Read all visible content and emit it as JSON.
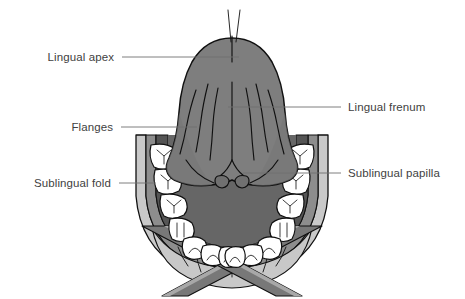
{
  "figure": {
    "width": 465,
    "height": 299,
    "background": "#ffffff"
  },
  "palette": {
    "background": "#ffffff",
    "tongue_fill": "#7e7e7e",
    "tongue_shadow": "#6e6e6e",
    "gingiva_fill": "#555555",
    "floor_fill": "#666666",
    "mucosa_band": "#8d8d8d",
    "cheek_fill": "#c9c9c9",
    "lip_fill": "#c8c8c8",
    "strap_fill": "#787878",
    "strap_edge": "#a8a8a8",
    "tooth_fill": "#ffffff",
    "outline": "#101010",
    "label_text": "#414141",
    "leader_line": "#6f6f6f"
  },
  "labels": [
    {
      "id": "lingual-apex",
      "text": "Lingual apex",
      "side": "left",
      "text_x": 114,
      "text_y": 61,
      "leader": {
        "x1": 122,
        "y1": 57,
        "x2": 239,
        "y2": 57
      }
    },
    {
      "id": "flanges",
      "text": "Flanges",
      "side": "left",
      "text_x": 113,
      "text_y": 131,
      "leader": {
        "x1": 121,
        "y1": 127,
        "x2": 197,
        "y2": 127
      }
    },
    {
      "id": "sublingual-fold",
      "text": "Sublingual fold",
      "side": "left",
      "text_x": 111,
      "text_y": 187,
      "leader": {
        "x1": 119,
        "y1": 183,
        "x2": 156,
        "y2": 183
      }
    },
    {
      "id": "lingual-frenum",
      "text": "Lingual frenum",
      "side": "right",
      "text_x": 348,
      "text_y": 111,
      "leader": {
        "x1": 228,
        "y1": 107,
        "x2": 341,
        "y2": 107
      }
    },
    {
      "id": "sublingual-papilla",
      "text": "Sublingual papilla",
      "side": "right",
      "text_x": 348,
      "text_y": 177,
      "leader": {
        "x1": 243,
        "y1": 173,
        "x2": 341,
        "y2": 173
      }
    }
  ],
  "anatomy": {
    "tongue": {
      "name": "tongue-inferior-surface",
      "description": "Bell-shaped tongue underside, medium gray with dark outline",
      "apex_y": 38
    },
    "frenum": {
      "name": "lingual-frenum",
      "description": "Central vertical midline fold running from apex to floor of mouth"
    },
    "papillae": {
      "name": "sublingual-papillae",
      "description": "Two small rounded bumps at the base of the frenum",
      "count": 2
    },
    "veins_per_side": 3,
    "teeth": {
      "name": "mandibular-dental-arch",
      "total": 16,
      "left_count": 8,
      "right_count": 8,
      "types": [
        "molar",
        "molar",
        "premolar",
        "premolar",
        "canine",
        "incisor",
        "incisor",
        "incisor"
      ]
    },
    "lip": {
      "name": "lower-lip",
      "crease_count": 6
    },
    "retractors": {
      "name": "cheek-retractor-straps",
      "count": 2
    }
  }
}
